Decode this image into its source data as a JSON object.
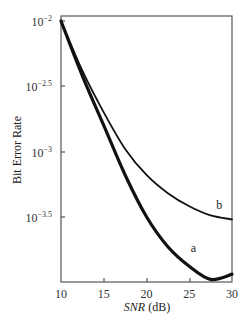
{
  "chart_data": {
    "type": "line",
    "title": "",
    "xlabel": "SNR (dB)",
    "ylabel": "Bit Error Rate",
    "xlim": [
      10,
      30
    ],
    "ylim_log10": [
      -4,
      -2
    ],
    "yscale": "log",
    "grid": false,
    "x_ticks": [
      "10",
      "15",
      "20",
      "25",
      "30"
    ],
    "y_ticks": [
      "10^-2",
      "10^-2.5",
      "10^-3",
      "10^-3.5"
    ],
    "series": [
      {
        "name": "a",
        "x": [
          10,
          12.5,
          15,
          17.5,
          20,
          22.5,
          25,
          27.5,
          30
        ],
        "log10_y": [
          -2.0,
          -2.42,
          -2.8,
          -3.18,
          -3.5,
          -3.73,
          -3.88,
          -3.98,
          -3.94
        ]
      },
      {
        "name": "b",
        "x": [
          10,
          12.5,
          15,
          17.5,
          20,
          22.5,
          25,
          27.5,
          30
        ],
        "log10_y": [
          -2.0,
          -2.38,
          -2.7,
          -2.98,
          -3.18,
          -3.32,
          -3.42,
          -3.49,
          -3.52
        ]
      }
    ],
    "annotations": [
      {
        "text": "a",
        "x": 25.5,
        "log10_y": -3.77
      },
      {
        "text": "b",
        "x": 28.5,
        "log10_y": -3.44
      }
    ]
  }
}
